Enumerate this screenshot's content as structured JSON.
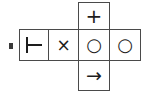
{
  "figure": {
    "label_marker": "",
    "layout": "cross",
    "cells": [
      {
        "id": "left-arm",
        "position": "row-col-1",
        "symbol_name": "turnstile-symbol",
        "symbol": "⊢"
      },
      {
        "id": "times",
        "position": "row-col-2",
        "symbol_name": "times-symbol",
        "symbol": "×"
      },
      {
        "id": "center",
        "position": "row-col-3",
        "symbol_name": "circle-symbol",
        "symbol": "○"
      },
      {
        "id": "right-arm",
        "position": "row-col-4",
        "symbol_name": "circle-symbol",
        "symbol": "○"
      },
      {
        "id": "top-arm",
        "position": "col-top",
        "symbol_name": "plus-symbol",
        "symbol": "+"
      },
      {
        "id": "bottom-arm",
        "position": "col-bottom",
        "symbol_name": "arrow-right-symbol",
        "symbol": "→"
      }
    ],
    "colors": {
      "border": "#4a4a4a",
      "glyph": "#1d1d1d",
      "background": "#ffffff",
      "marker": "#3a3a3a"
    }
  }
}
